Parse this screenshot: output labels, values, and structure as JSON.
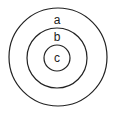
{
  "diagram": {
    "type": "concentric-circles",
    "stroke_color": "#222222",
    "background": "#ffffff",
    "circles": [
      {
        "label": "a",
        "cx": 58,
        "cy": 57,
        "r": 49,
        "label_y": 20
      },
      {
        "label": "b",
        "cx": 57,
        "cy": 58,
        "r": 30,
        "label_y": 37
      },
      {
        "label": "c",
        "cx": 57,
        "cy": 58,
        "r": 13,
        "label_y": 58
      }
    ]
  }
}
